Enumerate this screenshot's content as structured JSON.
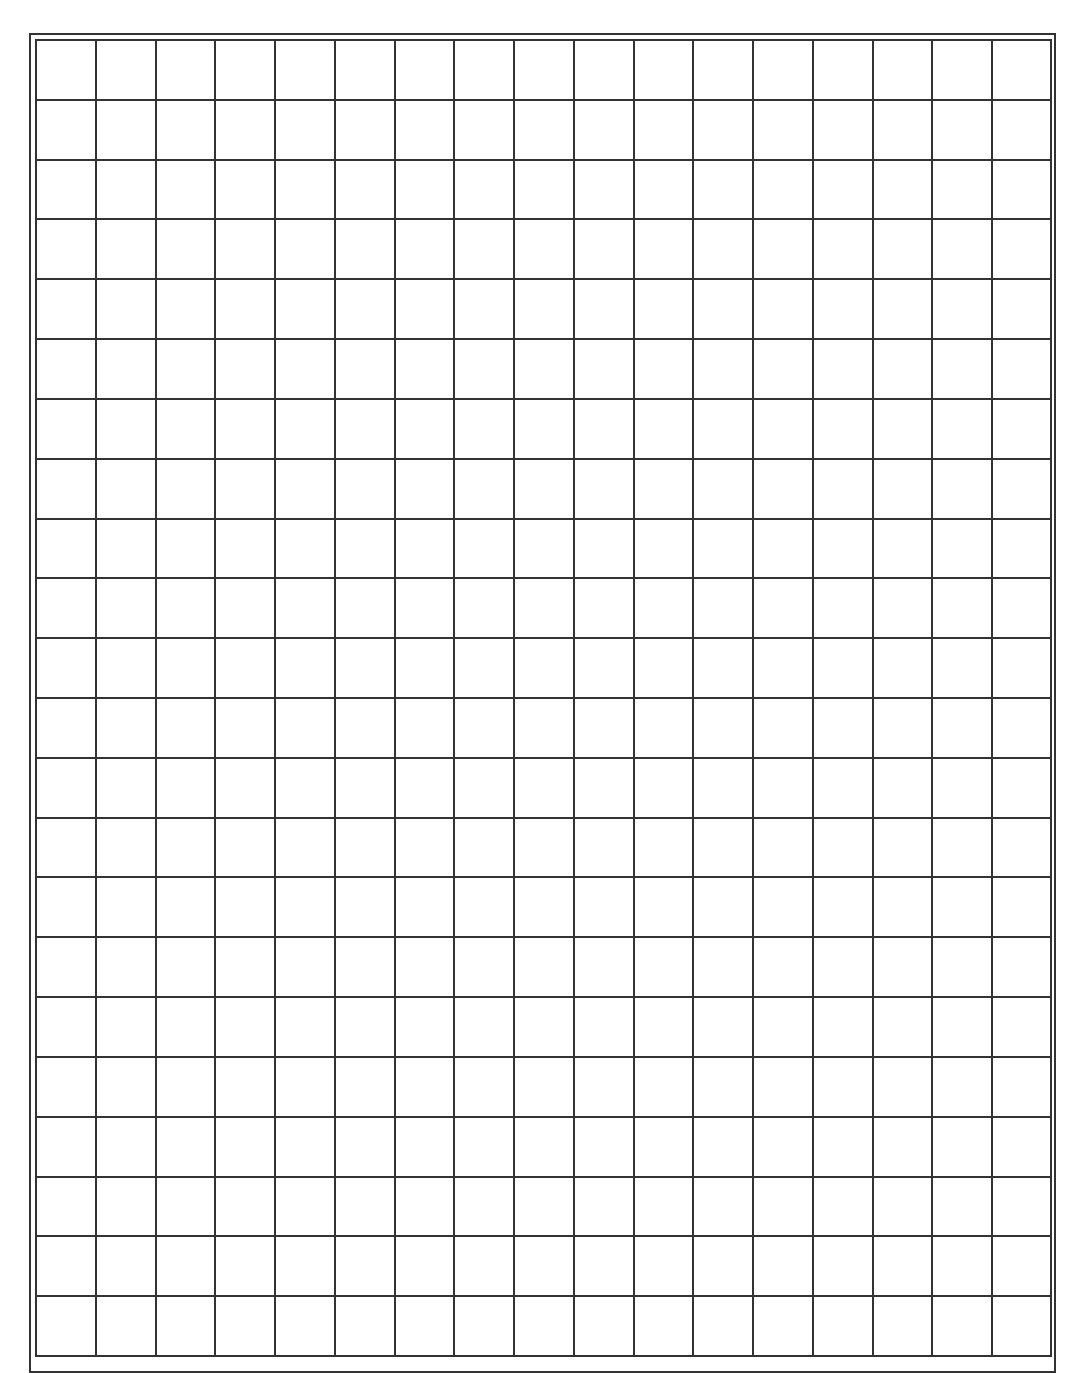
{
  "page": {
    "type": "graph-paper-worksheet",
    "running_header": "",
    "grid": {
      "columns": 17,
      "rows": 22,
      "line_color": "#333333",
      "background": "#ffffff",
      "border_style": "double"
    }
  }
}
